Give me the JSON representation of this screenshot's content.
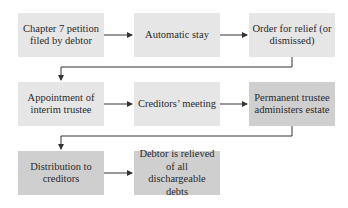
{
  "diagram": {
    "type": "flowchart",
    "rows": [
      {
        "boxes": [
          {
            "id": "petition",
            "label": "Chapter 7 petition filed by debtor",
            "shade": "light"
          },
          {
            "id": "stay",
            "label": "Automatic stay",
            "shade": "light"
          },
          {
            "id": "order",
            "label": "Order for relief (or dismissed)",
            "shade": "light"
          }
        ]
      },
      {
        "boxes": [
          {
            "id": "interim",
            "label": "Appointment of interim trustee",
            "shade": "light"
          },
          {
            "id": "meeting",
            "label": "Creditors’ meeting",
            "shade": "light"
          },
          {
            "id": "permanent",
            "label": "Permanent trustee administers estate",
            "shade": "dark"
          }
        ]
      },
      {
        "boxes": [
          {
            "id": "distribution",
            "label": "Distribution to creditors",
            "shade": "dark"
          },
          {
            "id": "relieved",
            "label": "Debtor is relieved of all dischargeable debts",
            "shade": "dark"
          }
        ]
      }
    ],
    "edges": [
      [
        "petition",
        "stay"
      ],
      [
        "stay",
        "order"
      ],
      [
        "order",
        "interim"
      ],
      [
        "interim",
        "meeting"
      ],
      [
        "meeting",
        "permanent"
      ],
      [
        "permanent",
        "distribution"
      ],
      [
        "distribution",
        "relieved"
      ]
    ],
    "colors": {
      "light_box": "#e6e6e6",
      "dark_box": "#cfcfcf",
      "line": "#333333",
      "text": "#2a2a2a"
    }
  }
}
